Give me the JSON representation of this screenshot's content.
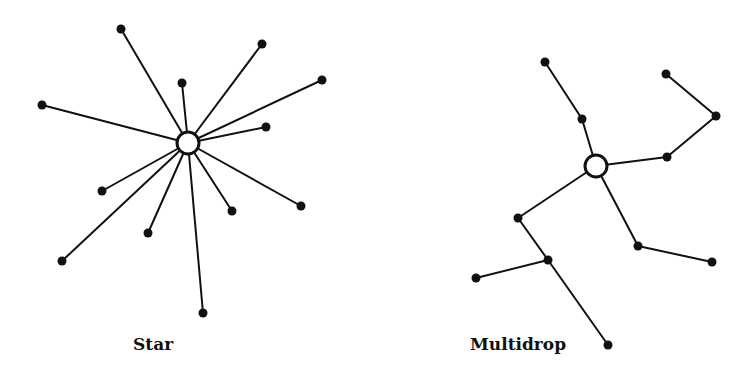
{
  "diagrams": {
    "star": {
      "label": "Star",
      "hub": {
        "x": 188,
        "y": 143,
        "r": 11
      },
      "leaves": [
        {
          "x": 121,
          "y": 29
        },
        {
          "x": 42,
          "y": 105
        },
        {
          "x": 182,
          "y": 83
        },
        {
          "x": 262,
          "y": 44
        },
        {
          "x": 322,
          "y": 80
        },
        {
          "x": 266,
          "y": 127
        },
        {
          "x": 301,
          "y": 206
        },
        {
          "x": 232,
          "y": 211
        },
        {
          "x": 203,
          "y": 313
        },
        {
          "x": 148,
          "y": 233
        },
        {
          "x": 62,
          "y": 261
        },
        {
          "x": 102,
          "y": 191
        }
      ]
    },
    "multidrop": {
      "label": "Multidrop",
      "hub": {
        "x": 596,
        "y": 166,
        "r": 11
      },
      "nodes": [
        {
          "id": "a",
          "x": 545,
          "y": 62
        },
        {
          "id": "b",
          "x": 582,
          "y": 119
        },
        {
          "id": "c",
          "x": 666,
          "y": 74
        },
        {
          "id": "d",
          "x": 716,
          "y": 116
        },
        {
          "id": "e",
          "x": 667,
          "y": 157
        },
        {
          "id": "f",
          "x": 518,
          "y": 218
        },
        {
          "id": "g",
          "x": 548,
          "y": 260
        },
        {
          "id": "h",
          "x": 476,
          "y": 278
        },
        {
          "id": "i",
          "x": 608,
          "y": 345
        },
        {
          "id": "j",
          "x": 638,
          "y": 246
        },
        {
          "id": "k",
          "x": 712,
          "y": 262
        }
      ],
      "edges": [
        [
          "hub",
          "b"
        ],
        [
          "b",
          "a"
        ],
        [
          "hub",
          "e"
        ],
        [
          "e",
          "d"
        ],
        [
          "d",
          "c"
        ],
        [
          "hub",
          "f"
        ],
        [
          "f",
          "g"
        ],
        [
          "g",
          "h"
        ],
        [
          "g",
          "i"
        ],
        [
          "hub",
          "j"
        ],
        [
          "j",
          "k"
        ]
      ]
    }
  }
}
